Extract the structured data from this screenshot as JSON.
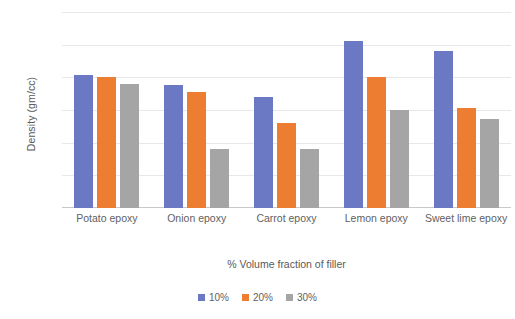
{
  "chart_data": {
    "type": "bar",
    "title": "",
    "xlabel": "% Volume fraction of filler",
    "ylabel": "Density (gm/cc)",
    "ylim": [
      0.95,
      1.25
    ],
    "ytick_labels": [
      "1.25",
      "1.2",
      "1.15",
      "1.1",
      "1.05",
      "1",
      "0.95"
    ],
    "yticks": [
      1.25,
      1.2,
      1.15,
      1.1,
      1.05,
      1.0,
      0.95
    ],
    "grid": true,
    "legend_position": "bottom",
    "categories": [
      "Potato epoxy",
      "Onion epoxy",
      "Carrot epoxy",
      "Lemon epoxy",
      "Sweet lime epoxy"
    ],
    "series": [
      {
        "name": "10%",
        "color": "#6B78C4",
        "values": [
          1.153,
          1.138,
          1.12,
          1.205,
          1.19
        ]
      },
      {
        "name": "20%",
        "color": "#ED7D31",
        "values": [
          1.15,
          1.128,
          1.08,
          1.15,
          1.103
        ]
      },
      {
        "name": "30%",
        "color": "#A5A5A5",
        "values": [
          1.14,
          1.04,
          1.04,
          1.1,
          1.087
        ]
      }
    ]
  },
  "legend": {
    "items": [
      {
        "label": "10%",
        "color": "#6B78C4"
      },
      {
        "label": "20%",
        "color": "#ED7D31"
      },
      {
        "label": "30%",
        "color": "#A5A5A5"
      }
    ]
  }
}
